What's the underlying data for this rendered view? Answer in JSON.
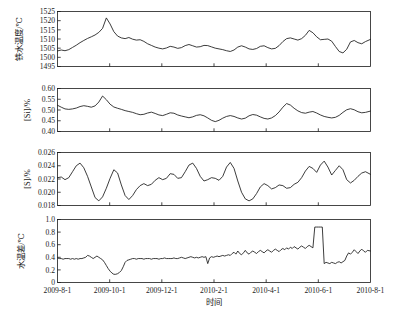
{
  "chart_data": [
    {
      "type": "line",
      "panel_index": 0,
      "title": "",
      "ylabel": "铁水温度/℃",
      "xlabel": "",
      "ylim": [
        1495,
        1525
      ],
      "yticks": [
        1495,
        1500,
        1505,
        1510,
        1515,
        1520,
        1525
      ],
      "ytick_labels": [
        "1495",
        "1500",
        "1505",
        "1510",
        "1515",
        "1520",
        "1525"
      ],
      "xlim": [
        "2009-8-1",
        "2010-8-1"
      ],
      "grid": false,
      "legend": null,
      "series": [
        {
          "name": "铁水温度",
          "x_fraction": [
            0.0,
            0.012,
            0.024,
            0.036,
            0.048,
            0.06,
            0.072,
            0.084,
            0.096,
            0.108,
            0.12,
            0.132,
            0.144,
            0.156,
            0.168,
            0.18,
            0.192,
            0.204,
            0.216,
            0.228,
            0.24,
            0.252,
            0.264,
            0.276,
            0.288,
            0.3,
            0.312,
            0.324,
            0.336,
            0.348,
            0.36,
            0.372,
            0.384,
            0.396,
            0.408,
            0.42,
            0.432,
            0.444,
            0.456,
            0.468,
            0.48,
            0.492,
            0.504,
            0.516,
            0.528,
            0.54,
            0.552,
            0.564,
            0.576,
            0.588,
            0.6,
            0.612,
            0.624,
            0.636,
            0.648,
            0.66,
            0.672,
            0.684,
            0.696,
            0.708,
            0.72,
            0.732,
            0.744,
            0.756,
            0.768,
            0.78,
            0.792,
            0.804,
            0.816,
            0.828,
            0.84,
            0.852,
            0.864,
            0.876,
            0.888,
            0.9,
            0.912,
            0.924,
            0.936,
            0.948,
            0.96,
            0.972,
            0.984,
            1.0
          ],
          "values": [
            1503.5,
            1504.0,
            1503.6,
            1504.2,
            1505.4,
            1506.6,
            1508.0,
            1509.2,
            1510.3,
            1511.2,
            1512.2,
            1513.6,
            1515.8,
            1521.5,
            1518.2,
            1514.0,
            1511.6,
            1510.6,
            1510.2,
            1510.8,
            1509.9,
            1509.4,
            1509.6,
            1508.7,
            1507.4,
            1506.5,
            1505.6,
            1505.0,
            1504.6,
            1505.1,
            1506.0,
            1505.6,
            1504.9,
            1505.3,
            1506.4,
            1507.0,
            1506.3,
            1505.6,
            1505.8,
            1506.5,
            1506.4,
            1505.7,
            1505.0,
            1504.6,
            1504.2,
            1503.6,
            1503.2,
            1504.0,
            1505.6,
            1506.3,
            1505.6,
            1504.6,
            1504.3,
            1504.8,
            1506.0,
            1506.3,
            1505.3,
            1504.6,
            1504.9,
            1506.4,
            1508.6,
            1510.2,
            1510.6,
            1510.0,
            1509.4,
            1510.2,
            1512.0,
            1514.7,
            1513.4,
            1511.2,
            1509.6,
            1509.8,
            1510.0,
            1508.8,
            1505.9,
            1503.2,
            1502.4,
            1504.4,
            1508.4,
            1509.2,
            1508.0,
            1507.4,
            1508.6,
            1509.8
          ]
        }
      ]
    },
    {
      "type": "line",
      "panel_index": 1,
      "title": "",
      "ylabel": "[Si]/%",
      "xlabel": "",
      "ylim": [
        0.4,
        0.6
      ],
      "yticks": [
        0.4,
        0.45,
        0.5,
        0.55,
        0.6
      ],
      "ytick_labels": [
        "0.40",
        "0.45",
        "0.50",
        "0.55",
        "0.60"
      ],
      "xlim": [
        "2009-8-1",
        "2010-8-1"
      ],
      "grid": false,
      "legend": null,
      "series": [
        {
          "name": "[Si]",
          "x_fraction": [
            0.0,
            0.012,
            0.024,
            0.036,
            0.048,
            0.06,
            0.072,
            0.084,
            0.096,
            0.108,
            0.12,
            0.132,
            0.144,
            0.156,
            0.168,
            0.18,
            0.192,
            0.204,
            0.216,
            0.228,
            0.24,
            0.252,
            0.264,
            0.276,
            0.288,
            0.3,
            0.312,
            0.324,
            0.336,
            0.348,
            0.36,
            0.372,
            0.384,
            0.396,
            0.408,
            0.42,
            0.432,
            0.444,
            0.456,
            0.468,
            0.48,
            0.492,
            0.504,
            0.516,
            0.528,
            0.54,
            0.552,
            0.564,
            0.576,
            0.588,
            0.6,
            0.612,
            0.624,
            0.636,
            0.648,
            0.66,
            0.672,
            0.684,
            0.696,
            0.708,
            0.72,
            0.732,
            0.744,
            0.756,
            0.768,
            0.78,
            0.792,
            0.804,
            0.816,
            0.828,
            0.84,
            0.852,
            0.864,
            0.876,
            0.888,
            0.9,
            0.912,
            0.924,
            0.936,
            0.948,
            0.96,
            0.972,
            0.984,
            1.0
          ],
          "values": [
            0.522,
            0.513,
            0.505,
            0.503,
            0.505,
            0.509,
            0.516,
            0.52,
            0.517,
            0.513,
            0.519,
            0.537,
            0.565,
            0.548,
            0.527,
            0.514,
            0.508,
            0.503,
            0.497,
            0.493,
            0.489,
            0.483,
            0.478,
            0.48,
            0.486,
            0.49,
            0.484,
            0.477,
            0.474,
            0.48,
            0.487,
            0.485,
            0.477,
            0.472,
            0.468,
            0.464,
            0.468,
            0.475,
            0.478,
            0.473,
            0.463,
            0.452,
            0.446,
            0.452,
            0.462,
            0.47,
            0.474,
            0.47,
            0.463,
            0.458,
            0.462,
            0.473,
            0.479,
            0.476,
            0.468,
            0.461,
            0.458,
            0.463,
            0.474,
            0.491,
            0.513,
            0.53,
            0.523,
            0.508,
            0.496,
            0.488,
            0.485,
            0.49,
            0.493,
            0.486,
            0.477,
            0.47,
            0.466,
            0.463,
            0.466,
            0.475,
            0.489,
            0.501,
            0.506,
            0.501,
            0.492,
            0.487,
            0.489,
            0.495
          ]
        }
      ]
    },
    {
      "type": "line",
      "panel_index": 2,
      "title": "",
      "ylabel": "[S]/%",
      "xlabel": "",
      "ylim": [
        0.018,
        0.026
      ],
      "yticks": [
        0.018,
        0.02,
        0.022,
        0.024,
        0.026
      ],
      "ytick_labels": [
        "0.018",
        "0.020",
        "0.022",
        "0.024",
        "0.026"
      ],
      "xlim": [
        "2009-8-1",
        "2010-8-1"
      ],
      "grid": false,
      "legend": null,
      "series": [
        {
          "name": "[S]",
          "x_fraction": [
            0.0,
            0.012,
            0.024,
            0.036,
            0.048,
            0.06,
            0.072,
            0.084,
            0.096,
            0.108,
            0.12,
            0.132,
            0.144,
            0.156,
            0.168,
            0.18,
            0.192,
            0.204,
            0.216,
            0.228,
            0.24,
            0.252,
            0.264,
            0.276,
            0.288,
            0.3,
            0.312,
            0.324,
            0.336,
            0.348,
            0.36,
            0.372,
            0.384,
            0.396,
            0.408,
            0.42,
            0.432,
            0.444,
            0.456,
            0.468,
            0.48,
            0.492,
            0.504,
            0.516,
            0.528,
            0.54,
            0.552,
            0.564,
            0.576,
            0.588,
            0.6,
            0.612,
            0.624,
            0.636,
            0.648,
            0.66,
            0.672,
            0.684,
            0.696,
            0.708,
            0.72,
            0.732,
            0.744,
            0.756,
            0.768,
            0.78,
            0.792,
            0.804,
            0.816,
            0.828,
            0.84,
            0.852,
            0.864,
            0.876,
            0.888,
            0.9,
            0.912,
            0.924,
            0.936,
            0.948,
            0.96,
            0.972,
            0.984,
            1.0
          ],
          "values": [
            0.0222,
            0.0223,
            0.0219,
            0.0222,
            0.0231,
            0.024,
            0.0244,
            0.0237,
            0.0224,
            0.0208,
            0.0192,
            0.0187,
            0.0193,
            0.0206,
            0.0221,
            0.0234,
            0.0229,
            0.0211,
            0.0195,
            0.0189,
            0.0195,
            0.0204,
            0.021,
            0.0213,
            0.021,
            0.0212,
            0.0218,
            0.0222,
            0.0219,
            0.0221,
            0.0228,
            0.0227,
            0.0221,
            0.0222,
            0.0231,
            0.0241,
            0.0244,
            0.0236,
            0.0224,
            0.0217,
            0.0219,
            0.0222,
            0.0221,
            0.0218,
            0.0224,
            0.0238,
            0.0245,
            0.0236,
            0.0217,
            0.02,
            0.019,
            0.0187,
            0.019,
            0.0198,
            0.0208,
            0.0213,
            0.021,
            0.0205,
            0.0207,
            0.0211,
            0.021,
            0.0206,
            0.0207,
            0.0212,
            0.0215,
            0.0222,
            0.0232,
            0.0239,
            0.0236,
            0.023,
            0.0241,
            0.0247,
            0.0238,
            0.0226,
            0.0233,
            0.024,
            0.0234,
            0.0219,
            0.0214,
            0.0218,
            0.0224,
            0.0229,
            0.0231,
            0.0227
          ]
        }
      ]
    },
    {
      "type": "line",
      "panel_index": 3,
      "title": "",
      "ylabel": "水温差/℃",
      "xlabel": "时间",
      "ylim": [
        0,
        1.0
      ],
      "yticks": [
        0,
        0.2,
        0.4,
        0.6,
        0.8,
        1.0
      ],
      "ytick_labels": [
        "0",
        "0.2",
        "0.4",
        "0.6",
        "0.8",
        "1.0"
      ],
      "xlim": [
        "2009-8-1",
        "2010-8-1"
      ],
      "grid": false,
      "legend": null,
      "series": [
        {
          "name": "水温差",
          "x_fraction": [
            0.0,
            0.006,
            0.012,
            0.018,
            0.024,
            0.03,
            0.036,
            0.042,
            0.048,
            0.054,
            0.06,
            0.066,
            0.072,
            0.078,
            0.084,
            0.09,
            0.096,
            0.102,
            0.108,
            0.114,
            0.12,
            0.126,
            0.132,
            0.138,
            0.144,
            0.15,
            0.156,
            0.162,
            0.168,
            0.174,
            0.18,
            0.186,
            0.192,
            0.198,
            0.204,
            0.21,
            0.216,
            0.222,
            0.228,
            0.234,
            0.24,
            0.246,
            0.252,
            0.258,
            0.264,
            0.27,
            0.276,
            0.282,
            0.288,
            0.294,
            0.3,
            0.306,
            0.312,
            0.318,
            0.324,
            0.33,
            0.336,
            0.342,
            0.348,
            0.354,
            0.36,
            0.366,
            0.372,
            0.378,
            0.384,
            0.39,
            0.396,
            0.402,
            0.408,
            0.414,
            0.42,
            0.426,
            0.432,
            0.438,
            0.444,
            0.45,
            0.456,
            0.462,
            0.468,
            0.474,
            0.48,
            0.486,
            0.492,
            0.498,
            0.504,
            0.51,
            0.516,
            0.522,
            0.528,
            0.534,
            0.54,
            0.546,
            0.552,
            0.558,
            0.564,
            0.57,
            0.576,
            0.582,
            0.588,
            0.594,
            0.6,
            0.606,
            0.612,
            0.618,
            0.624,
            0.63,
            0.636,
            0.642,
            0.648,
            0.654,
            0.66,
            0.666,
            0.672,
            0.678,
            0.684,
            0.69,
            0.696,
            0.702,
            0.708,
            0.714,
            0.72,
            0.726,
            0.732,
            0.738,
            0.744,
            0.75,
            0.756,
            0.762,
            0.768,
            0.774,
            0.78,
            0.786,
            0.792,
            0.798,
            0.804,
            0.81,
            0.816,
            0.822,
            0.828,
            0.834,
            0.84,
            0.846,
            0.852,
            0.858,
            0.864,
            0.87,
            0.876,
            0.882,
            0.888,
            0.894,
            0.9,
            0.906,
            0.912,
            0.918,
            0.924,
            0.93,
            0.936,
            0.942,
            0.948,
            0.954,
            0.96,
            0.966,
            0.972,
            0.978,
            0.984,
            0.99,
            1.0
          ],
          "values": [
            0.39,
            0.38,
            0.38,
            0.37,
            0.38,
            0.38,
            0.38,
            0.37,
            0.38,
            0.37,
            0.38,
            0.37,
            0.38,
            0.38,
            0.39,
            0.4,
            0.43,
            0.42,
            0.4,
            0.38,
            0.4,
            0.42,
            0.4,
            0.38,
            0.36,
            0.32,
            0.27,
            0.22,
            0.18,
            0.15,
            0.13,
            0.13,
            0.14,
            0.16,
            0.19,
            0.25,
            0.32,
            0.35,
            0.36,
            0.37,
            0.38,
            0.38,
            0.37,
            0.38,
            0.38,
            0.38,
            0.37,
            0.38,
            0.38,
            0.38,
            0.37,
            0.38,
            0.38,
            0.38,
            0.37,
            0.38,
            0.38,
            0.39,
            0.38,
            0.38,
            0.38,
            0.38,
            0.39,
            0.38,
            0.38,
            0.39,
            0.4,
            0.39,
            0.38,
            0.39,
            0.4,
            0.41,
            0.4,
            0.39,
            0.4,
            0.39,
            0.4,
            0.41,
            0.4,
            0.41,
            0.3,
            0.39,
            0.41,
            0.4,
            0.41,
            0.42,
            0.41,
            0.42,
            0.43,
            0.42,
            0.43,
            0.44,
            0.43,
            0.46,
            0.48,
            0.45,
            0.5,
            0.46,
            0.44,
            0.47,
            0.51,
            0.47,
            0.45,
            0.48,
            0.5,
            0.48,
            0.46,
            0.49,
            0.51,
            0.49,
            0.47,
            0.5,
            0.52,
            0.5,
            0.48,
            0.51,
            0.53,
            0.51,
            0.49,
            0.52,
            0.54,
            0.52,
            0.55,
            0.53,
            0.56,
            0.54,
            0.57,
            0.55,
            0.53,
            0.56,
            0.58,
            0.56,
            0.54,
            0.57,
            0.59,
            0.57,
            0.55,
            0.88,
            0.88,
            0.88,
            0.88,
            0.88,
            0.3,
            0.32,
            0.31,
            0.3,
            0.32,
            0.31,
            0.3,
            0.32,
            0.33,
            0.31,
            0.33,
            0.35,
            0.42,
            0.47,
            0.45,
            0.48,
            0.52,
            0.49,
            0.46,
            0.5,
            0.53,
            0.5,
            0.48,
            0.51,
            0.5,
            0.49,
            0.5
          ]
        }
      ]
    }
  ],
  "xaxis": {
    "label": "时间",
    "tick_labels": [
      "2009-8-1",
      "2009-10-1",
      "2009-12-1",
      "2010-2-1",
      "2010-4-1",
      "2010-6-1",
      "2010-8-1"
    ],
    "tick_fractions": [
      0.0,
      0.1667,
      0.3333,
      0.5,
      0.6667,
      0.8333,
      1.0
    ]
  },
  "panels": [
    {
      "ylabel": "铁水温度/℃"
    },
    {
      "ylabel": "[Si]/%"
    },
    {
      "ylabel": "[S]/%"
    },
    {
      "ylabel": "水温差/℃"
    }
  ],
  "colors": {
    "line": "#1a1a1a",
    "axis": "#1a1a1a",
    "background": "#ffffff"
  }
}
